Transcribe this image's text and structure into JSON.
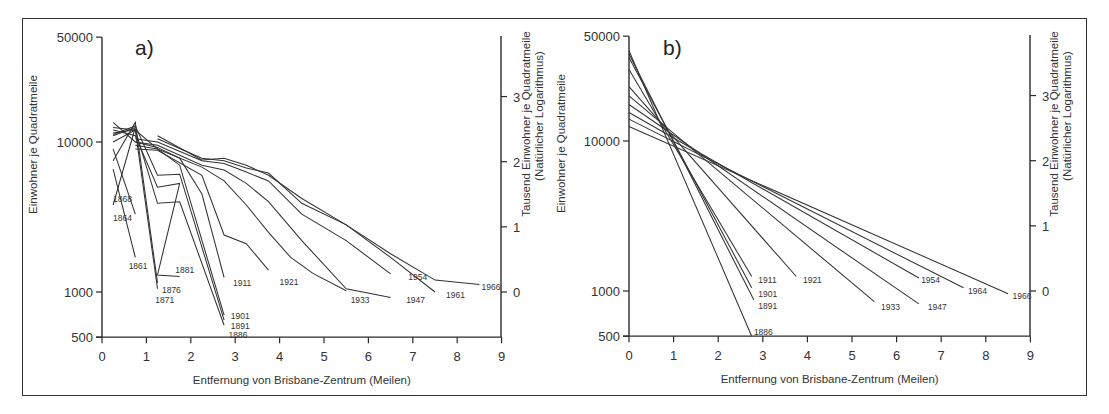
{
  "figure": {
    "panels": [
      {
        "id": "a",
        "label": "a)"
      },
      {
        "id": "b",
        "label": "b)"
      }
    ],
    "xlabel": "Entfernung von Brisbane-Zentrum   (Meilen)",
    "ylabel_left": "Einwohner je Quadratmeile",
    "ylabel_right_line1": "Tausend Einwohner je Quadratmeile",
    "ylabel_right_line2": "(Natürlicher Logarithmus)",
    "x_ticks": [
      "0",
      "1",
      "2",
      "3",
      "4",
      "5",
      "6",
      "7",
      "8",
      "9"
    ],
    "y_ticks_left": [
      "50000",
      "10000",
      "1000",
      "500"
    ],
    "y_ticks_right": [
      "3",
      "2",
      "1",
      "0"
    ]
  },
  "chart_data": [
    {
      "type": "line",
      "title": "a)",
      "xlabel": "Entfernung von Brisbane-Zentrum (Meilen)",
      "ylabel": "Einwohner je Quadratmeile",
      "ylabel_right": "Tausend Einwohner je Quadratmeile (Natürlicher Logarithmus)",
      "yscale": "log",
      "xlim": [
        0,
        9
      ],
      "ylim": [
        500,
        50000
      ],
      "x_ticks": [
        0,
        1,
        2,
        3,
        4,
        5,
        6,
        7,
        8,
        9
      ],
      "y_ticks_left": [
        500,
        1000,
        10000,
        50000
      ],
      "y_ticks_right": [
        0,
        1,
        2,
        3
      ],
      "grid": false,
      "series": [
        {
          "name": "1861",
          "points": [
            [
              0.25,
              6600
            ],
            [
              0.75,
              1700
            ]
          ],
          "label_at": [
            0.6,
            1480
          ]
        },
        {
          "name": "1864",
          "points": [
            [
              0.25,
              9000
            ],
            [
              0.75,
              3300
            ]
          ],
          "label_at": [
            0.25,
            3100
          ]
        },
        {
          "name": "1868",
          "points": [
            [
              0.25,
              11000
            ],
            [
              0.75,
              12500
            ],
            [
              0.25,
              3800
            ]
          ],
          "label_at": [
            0.25,
            4150
          ]
        },
        {
          "name": "1871",
          "points": [
            [
              0.25,
              11500
            ],
            [
              0.75,
              12000
            ],
            [
              1.25,
              1050
            ]
          ],
          "label_at": [
            1.2,
            890
          ]
        },
        {
          "name": "1876",
          "points": [
            [
              0.25,
              7500
            ],
            [
              0.75,
              13500
            ],
            [
              1.25,
              1150
            ]
          ],
          "label_at": [
            1.35,
            1030
          ]
        },
        {
          "name": "1881",
          "points": [
            [
              0.25,
              12000
            ],
            [
              0.75,
              11000
            ],
            [
              1.25,
              5000
            ],
            [
              1.75,
              5300
            ],
            [
              1.25,
              1300
            ],
            [
              1.75,
              1270
            ]
          ],
          "label_at": [
            1.65,
            1400
          ]
        },
        {
          "name": "1886",
          "points": [
            [
              0.25,
              10000
            ],
            [
              0.75,
              12000
            ],
            [
              1.25,
              3900
            ],
            [
              1.75,
              4000
            ],
            [
              2.75,
              600
            ]
          ],
          "label_at": [
            2.85,
            520
          ]
        },
        {
          "name": "1891",
          "points": [
            [
              0.25,
              11200
            ],
            [
              0.75,
              12800
            ],
            [
              1.25,
              6000
            ],
            [
              1.75,
              6100
            ],
            [
              2.75,
              650
            ]
          ],
          "label_at": [
            2.9,
            590
          ]
        },
        {
          "name": "1901",
          "points": [
            [
              0.25,
              12500
            ],
            [
              0.75,
              12000
            ],
            [
              1.25,
              9000
            ],
            [
              1.75,
              7000
            ],
            [
              2.75,
              700
            ]
          ],
          "label_at": [
            2.9,
            690
          ]
        },
        {
          "name": "1911",
          "points": [
            [
              0.25,
              13500
            ],
            [
              0.75,
              10000
            ],
            [
              1.25,
              9200
            ],
            [
              1.75,
              7800
            ],
            [
              2.25,
              4500
            ],
            [
              2.75,
              1250
            ]
          ],
          "label_at": [
            2.95,
            1150
          ]
        },
        {
          "name": "1921",
          "points": [
            [
              0.75,
              9000
            ],
            [
              1.25,
              8800
            ],
            [
              2.25,
              6000
            ],
            [
              2.75,
              2400
            ],
            [
              3.25,
              2100
            ],
            [
              3.75,
              1400
            ]
          ],
          "label_at": [
            4.0,
            1160
          ]
        },
        {
          "name": "1933",
          "points": [
            [
              0.75,
              9500
            ],
            [
              1.25,
              9000
            ],
            [
              2.25,
              6800
            ],
            [
              2.75,
              5500
            ],
            [
              3.25,
              3800
            ],
            [
              3.75,
              2500
            ],
            [
              4.25,
              1700
            ],
            [
              4.75,
              1330
            ],
            [
              5.5,
              1020
            ]
          ],
          "label_at": [
            5.6,
            890
          ]
        },
        {
          "name": "1947",
          "points": [
            [
              0.75,
              10000
            ],
            [
              1.25,
              9500
            ],
            [
              2.25,
              7000
            ],
            [
              2.75,
              6500
            ],
            [
              3.25,
              5300
            ],
            [
              3.75,
              4000
            ],
            [
              4.5,
              2200
            ],
            [
              5.5,
              1050
            ],
            [
              6.5,
              920
            ]
          ],
          "label_at": [
            6.85,
            880
          ]
        },
        {
          "name": "1954",
          "points": [
            [
              0.75,
              10500
            ],
            [
              1.25,
              10000
            ],
            [
              2.25,
              7500
            ],
            [
              2.75,
              7200
            ],
            [
              3.25,
              6300
            ],
            [
              3.75,
              5500
            ],
            [
              4.5,
              3300
            ],
            [
              5.5,
              2200
            ],
            [
              6.5,
              1320
            ]
          ],
          "label_at": [
            6.9,
            1250
          ]
        },
        {
          "name": "1961",
          "points": [
            [
              1.25,
              10500
            ],
            [
              2.25,
              7800
            ],
            [
              2.75,
              7500
            ],
            [
              3.25,
              6700
            ],
            [
              3.75,
              6200
            ],
            [
              4.5,
              3900
            ],
            [
              5.5,
              2800
            ],
            [
              6.5,
              1700
            ],
            [
              7.5,
              1000
            ]
          ],
          "label_at": [
            7.75,
            950
          ]
        },
        {
          "name": "1966",
          "points": [
            [
              1.25,
              11000
            ],
            [
              2.25,
              7600
            ],
            [
              2.75,
              7800
            ],
            [
              3.25,
              7000
            ],
            [
              3.75,
              6000
            ],
            [
              4.5,
              4200
            ],
            [
              5.5,
              2800
            ],
            [
              6.5,
              1800
            ],
            [
              7.5,
              1200
            ],
            [
              8.5,
              1120
            ]
          ],
          "label_at": [
            8.55,
            1080
          ]
        }
      ]
    },
    {
      "type": "line",
      "title": "b)",
      "xlabel": "Entfernung von Brisbane-Zentrum (Meilen)",
      "ylabel": "Einwohner je Quadratmeile",
      "ylabel_right": "Tausend Einwohner je Quadratmeile (Natürlicher Logarithmus)",
      "yscale": "log",
      "xlim": [
        0,
        9
      ],
      "ylim": [
        500,
        50000
      ],
      "x_ticks": [
        0,
        1,
        2,
        3,
        4,
        5,
        6,
        7,
        8,
        9
      ],
      "y_ticks_left": [
        500,
        1000,
        10000,
        50000
      ],
      "y_ticks_right": [
        0,
        1,
        2,
        3
      ],
      "grid": false,
      "series": [
        {
          "name": "1886",
          "points": [
            [
              0,
              40000
            ],
            [
              2.75,
              500
            ]
          ],
          "label_at": [
            2.8,
            530
          ]
        },
        {
          "name": "1891",
          "points": [
            [
              0,
              38000
            ],
            [
              2.8,
              870
            ]
          ],
          "label_at": [
            2.9,
            800
          ]
        },
        {
          "name": "1901",
          "points": [
            [
              0,
              36000
            ],
            [
              2.75,
              1050
            ]
          ],
          "label_at": [
            2.9,
            960
          ]
        },
        {
          "name": "1911",
          "points": [
            [
              0,
              30000
            ],
            [
              2.75,
              1250
            ]
          ],
          "label_at": [
            2.9,
            1190
          ]
        },
        {
          "name": "1921",
          "points": [
            [
              0,
              23000
            ],
            [
              3.75,
              1250
            ]
          ],
          "label_at": [
            3.9,
            1190
          ]
        },
        {
          "name": "1933",
          "points": [
            [
              0,
              20000
            ],
            [
              5.5,
              850
            ]
          ],
          "label_at": [
            5.65,
            780
          ]
        },
        {
          "name": "1947",
          "points": [
            [
              0,
              17500
            ],
            [
              6.5,
              820
            ]
          ],
          "label_at": [
            6.7,
            780
          ]
        },
        {
          "name": "1954",
          "points": [
            [
              0,
              15500
            ],
            [
              6.5,
              1220
            ]
          ],
          "label_at": [
            6.55,
            1180
          ]
        },
        {
          "name": "1964",
          "points": [
            [
              0,
              14000
            ],
            [
              7.5,
              1050
            ]
          ],
          "label_at": [
            7.6,
            1000
          ]
        },
        {
          "name": "1966",
          "points": [
            [
              0,
              12500
            ],
            [
              8.5,
              960
            ]
          ],
          "label_at": [
            8.6,
            930
          ]
        }
      ]
    }
  ]
}
